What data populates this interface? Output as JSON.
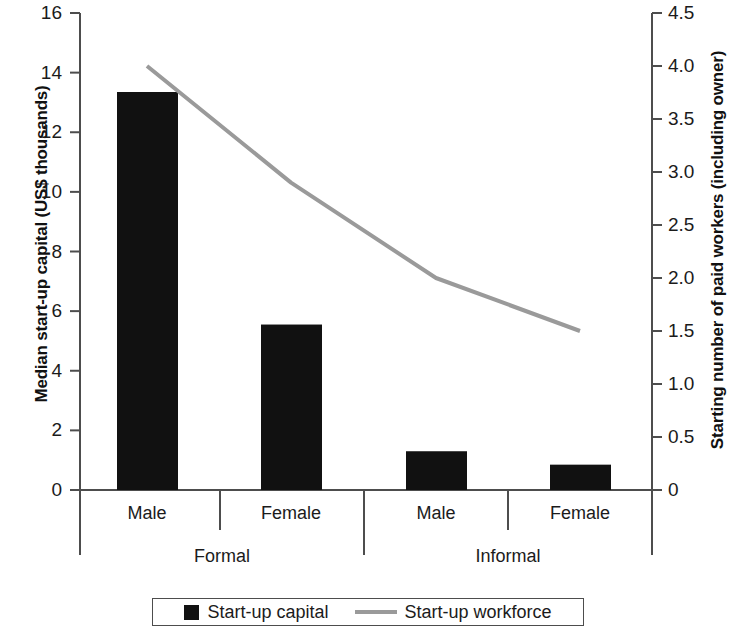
{
  "chart_data": {
    "type": "bar",
    "title": "",
    "categories": [
      "Male",
      "Female",
      "Male",
      "Female"
    ],
    "groups": [
      {
        "label": "Formal",
        "categories": [
          "Male",
          "Female"
        ]
      },
      {
        "label": "Informal",
        "categories": [
          "Male",
          "Female"
        ]
      }
    ],
    "series": [
      {
        "name": "Start-up capital",
        "type": "bar",
        "axis": "left",
        "color": "#111111",
        "values": [
          13.35,
          5.55,
          1.3,
          0.85
        ]
      },
      {
        "name": "Start-up workforce",
        "type": "line",
        "axis": "right",
        "color": "#9a9a9a",
        "values": [
          4.0,
          2.9,
          2.0,
          1.5
        ]
      }
    ],
    "xlabel": "",
    "ylabel": "Median start-up capital (US$ thousands)",
    "y2label": "Starting number of paid workers (including owner)",
    "ylim": [
      0,
      16
    ],
    "y2lim": [
      0,
      4.5
    ],
    "yticks": [
      "0",
      "2",
      "4",
      "6",
      "8",
      "10",
      "12",
      "14",
      "16"
    ],
    "ytick_values": [
      0,
      2,
      4,
      6,
      8,
      10,
      12,
      14,
      16
    ],
    "y2ticks": [
      "0",
      "0.5",
      "1.0",
      "1.5",
      "2.0",
      "2.5",
      "3.0",
      "3.5",
      "4.0",
      "4.5"
    ],
    "y2tick_values": [
      0,
      0.5,
      1.0,
      1.5,
      2.0,
      2.5,
      3.0,
      3.5,
      4.0,
      4.5
    ],
    "grid": false,
    "legend_position": "bottom"
  },
  "axes": {
    "left_title": "Median start-up capital (US$ thousands)",
    "right_title": "Starting number of paid workers (including owner)",
    "left_ticks": [
      "16",
      "14",
      "12",
      "10",
      "8",
      "6",
      "4",
      "2",
      "0"
    ],
    "right_ticks": [
      "4.5",
      "4.0",
      "3.5",
      "3.0",
      "2.5",
      "2.0",
      "1.5",
      "1.0",
      "0.5",
      "0"
    ]
  },
  "categories": {
    "items": [
      "Male",
      "Female",
      "Male",
      "Female"
    ],
    "groups": [
      "Formal",
      "Informal"
    ]
  },
  "legend": {
    "items": [
      {
        "label": "Start-up capital",
        "marker": "square",
        "color": "#111111"
      },
      {
        "label": "Start-up workforce",
        "marker": "line",
        "color": "#9a9a9a"
      }
    ]
  }
}
